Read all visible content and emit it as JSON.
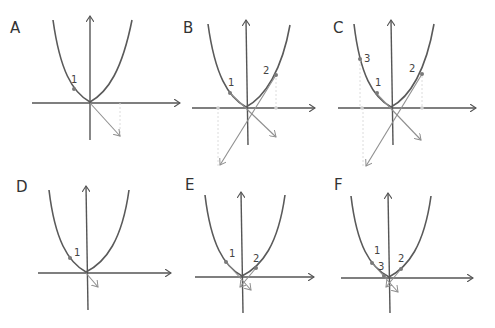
{
  "figure": {
    "colors": {
      "curve": "#5a5a5a",
      "axis": "#555555",
      "point": "#7a7a7a",
      "step_arrow": "#8f8f8f",
      "dashed_guide": "#dcdcdc"
    }
  },
  "panels": [
    {
      "id": "A",
      "label": "A",
      "points": [
        {
          "label": "1"
        }
      ]
    },
    {
      "id": "B",
      "label": "B",
      "points": [
        {
          "label": "1"
        },
        {
          "label": "2"
        }
      ]
    },
    {
      "id": "C",
      "label": "C",
      "points": [
        {
          "label": "1"
        },
        {
          "label": "2"
        },
        {
          "label": "3"
        }
      ]
    },
    {
      "id": "D",
      "label": "D",
      "points": [
        {
          "label": "1"
        }
      ]
    },
    {
      "id": "E",
      "label": "E",
      "points": [
        {
          "label": "1"
        },
        {
          "label": "2"
        }
      ]
    },
    {
      "id": "F",
      "label": "F",
      "points": [
        {
          "label": "1"
        },
        {
          "label": "2"
        },
        {
          "label": "3"
        }
      ]
    }
  ]
}
